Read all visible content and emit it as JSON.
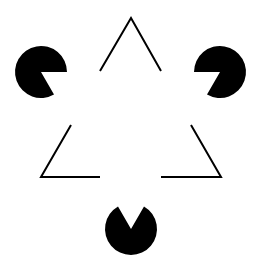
{
  "figure": {
    "background": "#ffffff",
    "ink": "#000000",
    "pacmen": [
      {
        "name": "top-left",
        "cx": 41,
        "cy": 72,
        "r": 26,
        "mouth_toward": "right-down"
      },
      {
        "name": "top-right",
        "cx": 220,
        "cy": 72,
        "r": 26,
        "mouth_toward": "left-down"
      },
      {
        "name": "bottom",
        "cx": 131,
        "cy": 229,
        "r": 26,
        "mouth_toward": "up"
      }
    ],
    "outline_fragments": [
      {
        "name": "top-apex",
        "points": "100,71 131,18 161,71"
      },
      {
        "name": "bottom-left-corner",
        "points": "71,125 41,177 100,177"
      },
      {
        "name": "bottom-right-corner",
        "points": "191,125 221,177 161,177"
      }
    ]
  }
}
